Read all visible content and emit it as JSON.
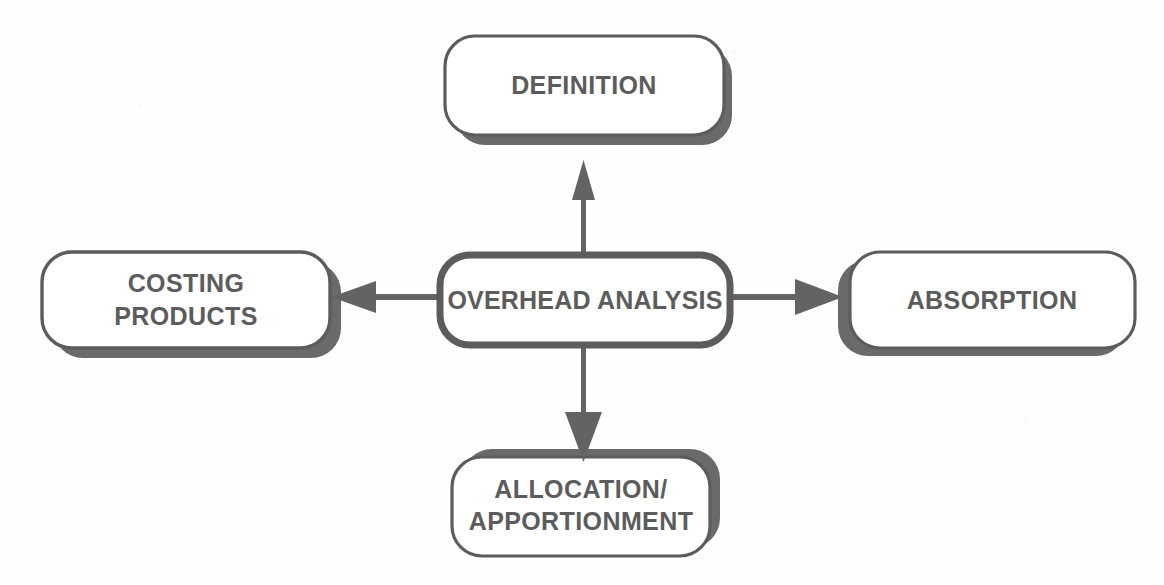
{
  "diagram": {
    "title": "Overhead Analysis",
    "type": "radial-concept-map",
    "background_color": "#ffffff",
    "stroke_color": "#5c5c5c",
    "shadow_color": "#6a6a6a",
    "text_color": "#5c5c5c",
    "center": {
      "id": "overhead-analysis",
      "label": "OVERHEAD ANALYSIS"
    },
    "nodes": [
      {
        "id": "definition",
        "label": "DEFINITION",
        "position": "top",
        "shadow": "bottom-right"
      },
      {
        "id": "costing",
        "label_line1": "COSTING",
        "label_line2": "PRODUCTS",
        "position": "left",
        "shadow": "right-bottom"
      },
      {
        "id": "absorption",
        "label": "ABSORPTION",
        "position": "right",
        "shadow": "left"
      },
      {
        "id": "allocation",
        "label_line1": "ALLOCATION/",
        "label_line2": "APPORTIONMENT",
        "position": "bottom",
        "shadow": "top-right"
      }
    ],
    "arrows": [
      {
        "id": "arrow-up",
        "from": "overhead-analysis",
        "to": "definition",
        "direction": "up"
      },
      {
        "id": "arrow-left",
        "from": "overhead-analysis",
        "to": "costing",
        "direction": "left"
      },
      {
        "id": "arrow-right",
        "from": "overhead-analysis",
        "to": "absorption",
        "direction": "right"
      },
      {
        "id": "arrow-down",
        "from": "overhead-analysis",
        "to": "allocation",
        "direction": "down"
      }
    ]
  }
}
